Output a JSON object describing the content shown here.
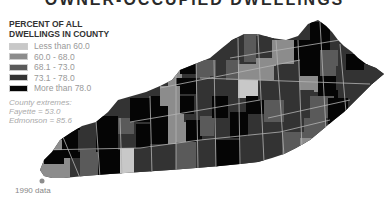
{
  "title": "OWNER-OCCUPIED DWELLINGS",
  "legend": {
    "title_line1": "PERCENT OF ALL",
    "title_line2": "DWELLINGS IN COUNTY",
    "items": [
      {
        "label": "Less than 60.0",
        "color": "#c8c8c8"
      },
      {
        "label": "60.0 - 68.0",
        "color": "#8c8c8c"
      },
      {
        "label": "68.1 - 73.0",
        "color": "#5a5a5a"
      },
      {
        "label": "73.1 - 78.0",
        "color": "#333333"
      },
      {
        "label": "More than 78.0",
        "color": "#050505"
      }
    ]
  },
  "extremes": {
    "heading": "County extremes:",
    "min": "Fayette = 53.0",
    "max": "Edmonson = 85.6"
  },
  "note": "1990 data",
  "map": {
    "region": "Kentucky",
    "border_color": "#b4b4b4"
  }
}
